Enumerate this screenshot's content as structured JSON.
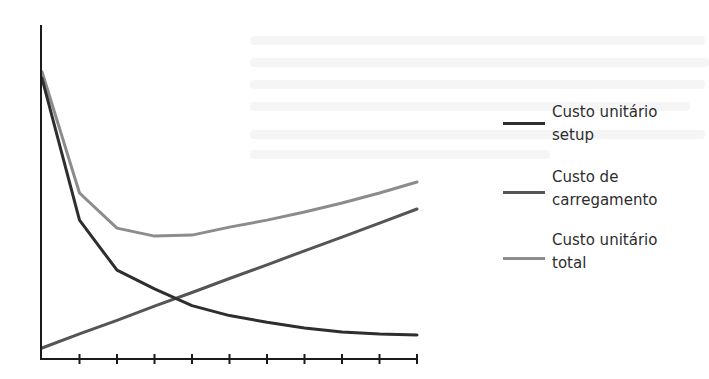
{
  "chart_data": {
    "type": "line",
    "title": "",
    "xlabel": "",
    "ylabel": "",
    "x": [
      0,
      1,
      2,
      3,
      4,
      5,
      6,
      7,
      8,
      9,
      10
    ],
    "xlim": [
      0,
      10
    ],
    "ylim": [
      0,
      100
    ],
    "grid": false,
    "x_ticks": 11,
    "y_ticks": false,
    "legend_position": "right",
    "series": [
      {
        "name": "Custo unitário setup",
        "color": "#2e2e2e",
        "values": [
          84,
          41.6,
          26.6,
          21,
          16,
          13,
          11,
          9.3,
          8.1,
          7.5,
          7.2
        ]
      },
      {
        "name": "Custo de carregamento",
        "color": "#555555",
        "values": [
          3.3,
          7.5,
          11.6,
          15.8,
          19.9,
          24.1,
          28.2,
          32.4,
          36.5,
          40.7,
          44.9
        ]
      },
      {
        "name": "Custo unitário total",
        "color": "#8c8c8c",
        "values": [
          86,
          49.7,
          39.2,
          36.8,
          37.1,
          39.5,
          41.6,
          44,
          46.7,
          49.7,
          53
        ]
      }
    ]
  },
  "legend": {
    "items": [
      {
        "label_line1": "Custo unitário",
        "label_line2": "setup",
        "color": "#2e2e2e"
      },
      {
        "label_line1": "Custo de",
        "label_line2": "carregamento",
        "color": "#555555"
      },
      {
        "label_line1": "Custo unitário",
        "label_line2": "total",
        "color": "#8c8c8c"
      }
    ]
  }
}
